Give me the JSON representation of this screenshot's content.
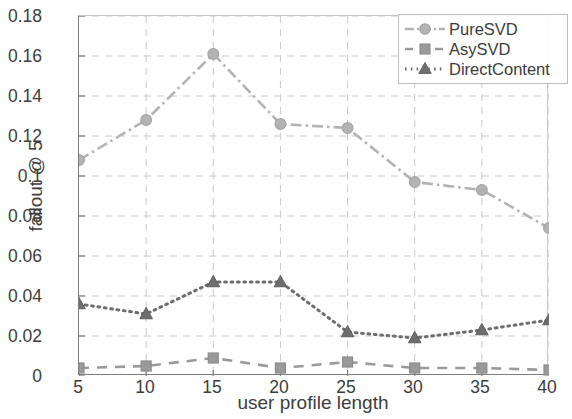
{
  "chart_data": {
    "type": "line",
    "title": "",
    "xlabel": "user profile length",
    "ylabel": "fallout @ 5",
    "x": [
      5,
      10,
      15,
      20,
      25,
      30,
      35,
      40
    ],
    "xticklabels": [
      "5",
      "10",
      "15",
      "20",
      "25",
      "30",
      "35",
      "40"
    ],
    "yticklabels": [
      "0",
      "0.02",
      "0.04",
      "0.06",
      "0.08",
      "0.1",
      "0.12",
      "0.14",
      "0.16",
      "0.18"
    ],
    "ytickvalues": [
      0,
      0.02,
      0.04,
      0.06,
      0.08,
      0.1,
      0.12,
      0.14,
      0.16,
      0.18
    ],
    "xlim": [
      5,
      40
    ],
    "ylim": [
      0,
      0.18
    ],
    "grid": true,
    "legend_position": "top-right",
    "series": [
      {
        "name": "PureSVD",
        "marker": "circle",
        "linestyle": "dash-dot",
        "color": "#b3b3b3",
        "values": [
          0.108,
          0.128,
          0.161,
          0.126,
          0.124,
          0.097,
          0.093,
          0.074
        ]
      },
      {
        "name": "AsySVD",
        "marker": "square",
        "linestyle": "dashed",
        "color": "#9a9a9a",
        "values": [
          0.004,
          0.005,
          0.009,
          0.004,
          0.007,
          0.004,
          0.004,
          0.003
        ]
      },
      {
        "name": "DirectContent",
        "marker": "triangle",
        "linestyle": "dotted",
        "color": "#6e6e6e",
        "values": [
          0.036,
          0.031,
          0.047,
          0.047,
          0.022,
          0.019,
          0.023,
          0.028
        ]
      }
    ]
  },
  "legend": {
    "entries": [
      {
        "label": "PureSVD"
      },
      {
        "label": "AsySVD"
      },
      {
        "label": "DirectContent"
      }
    ]
  },
  "axes": {
    "ylabel": "fallout @ 5",
    "xlabel": "user profile length"
  }
}
